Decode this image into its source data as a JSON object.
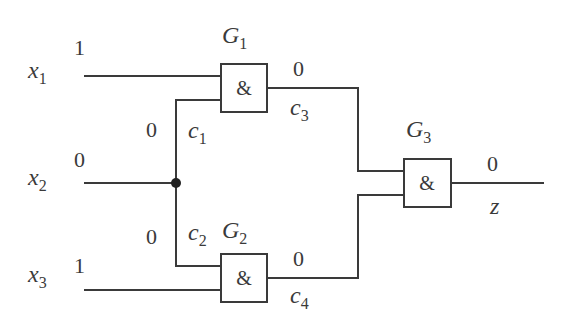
{
  "diagram": {
    "type": "logic-circuit",
    "inputs": [
      {
        "name": "x",
        "sub": "1",
        "value": "1"
      },
      {
        "name": "x",
        "sub": "2",
        "value": "0"
      },
      {
        "name": "x",
        "sub": "3",
        "value": "1"
      }
    ],
    "branches": [
      {
        "name": "c",
        "sub": "1",
        "value": "0"
      },
      {
        "name": "c",
        "sub": "2",
        "value": "0"
      }
    ],
    "gates": [
      {
        "name": "G",
        "sub": "1",
        "symbol": "&"
      },
      {
        "name": "G",
        "sub": "2",
        "symbol": "&"
      },
      {
        "name": "G",
        "sub": "3",
        "symbol": "&"
      }
    ],
    "internal": [
      {
        "name": "c",
        "sub": "3",
        "value": "0"
      },
      {
        "name": "c",
        "sub": "4",
        "value": "0"
      }
    ],
    "output": {
      "name": "z",
      "value": "0"
    },
    "colors": {
      "line": "#3a3a3a",
      "background": "#ffffff"
    }
  }
}
